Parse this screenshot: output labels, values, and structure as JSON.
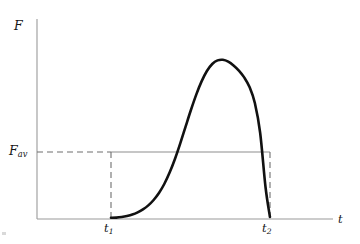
{
  "figure": {
    "background_color": "#ffffff"
  },
  "labels": {
    "y_axis": "F",
    "y_axis_name": "F",
    "average_main": "F",
    "average_sub": "av",
    "x_axis": "t",
    "t1_main": "t",
    "t1_sub": "1",
    "t2_main": "t",
    "t2_sub": "2"
  },
  "colors": {
    "curve": "#111111",
    "axis": "#9a9a9a",
    "dashed": "#6f6f6f",
    "average_line": "#8d8d8d",
    "text": "#161616",
    "background": "#ffffff"
  },
  "chart_data": {
    "type": "line",
    "title": "",
    "xlabel": "t",
    "ylabel": "F",
    "grid": false,
    "legend": false,
    "axis_arrows": false,
    "xlim": [
      0,
      1
    ],
    "ylim": [
      0,
      1
    ],
    "annotations": [
      {
        "name": "y-axis-label",
        "text": "F",
        "x": 0.0,
        "y": 1.0
      },
      {
        "name": "average-force-label",
        "text": "F_av",
        "x": 0.0,
        "y": 0.335
      },
      {
        "name": "t1-tick-label",
        "text": "t_1",
        "x": 0.25,
        "y": 0.0
      },
      {
        "name": "t2-tick-label",
        "text": "t_2",
        "x": 0.787,
        "y": 0.0
      },
      {
        "name": "x-axis-label",
        "text": "t",
        "x": 1.0,
        "y": 0.0
      }
    ],
    "reference_levels": [
      {
        "name": "F_av",
        "value": 0.335,
        "style": "dashed-then-solid"
      }
    ],
    "markers": [
      {
        "name": "t1",
        "x": 0.25,
        "style": "dashed-vertical"
      },
      {
        "name": "t2",
        "x": 0.787,
        "style": "dashed-vertical"
      }
    ],
    "series": [
      {
        "name": "F(t)",
        "style": "solid",
        "width": 2.6,
        "color": "#111111",
        "x": [
          0.25,
          0.268,
          0.286,
          0.304,
          0.322,
          0.34,
          0.358,
          0.376,
          0.394,
          0.412,
          0.43,
          0.448,
          0.466,
          0.484,
          0.502,
          0.52,
          0.538,
          0.556,
          0.574,
          0.592,
          0.61,
          0.628,
          0.646,
          0.664,
          0.682,
          0.7,
          0.718,
          0.736,
          0.754,
          0.772,
          0.787
        ],
        "y": [
          0.006,
          0.007,
          0.01,
          0.015,
          0.022,
          0.033,
          0.048,
          0.068,
          0.095,
          0.13,
          0.175,
          0.232,
          0.3,
          0.378,
          0.462,
          0.545,
          0.622,
          0.688,
          0.74,
          0.775,
          0.793,
          0.796,
          0.787,
          0.768,
          0.742,
          0.708,
          0.66,
          0.58,
          0.43,
          0.16,
          0.01
        ]
      }
    ]
  }
}
